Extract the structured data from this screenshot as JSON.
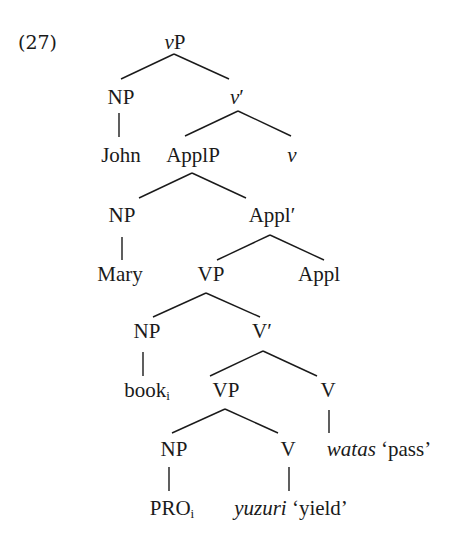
{
  "example_number": "(27)",
  "tree": {
    "root": {
      "label": "vP",
      "cat_italic": "v",
      "cat_rest": "P"
    },
    "subject_np": {
      "label": "NP",
      "terminal": "John"
    },
    "v_bar": {
      "cat_italic": "v",
      "rest": "′"
    },
    "v_head": {
      "label": "v"
    },
    "applp": {
      "label": "ApplP"
    },
    "applp_np": {
      "label": "NP",
      "terminal": "Mary"
    },
    "appl_bar": {
      "label": "Appl′"
    },
    "appl_head": {
      "label": "Appl"
    },
    "vp_upper": {
      "label": "VP"
    },
    "vp_upper_np": {
      "label": "NP",
      "terminal_base": "book",
      "terminal_index": "i"
    },
    "v_bar_upper": {
      "label": "V′"
    },
    "v_upper_head": {
      "label": "V",
      "word": "watas",
      "gloss": "‘pass’"
    },
    "vp_lower": {
      "label": "VP"
    },
    "vp_lower_np": {
      "label": "NP",
      "terminal_base": "PRO",
      "terminal_index": "i"
    },
    "v_lower_head": {
      "label": "V",
      "word": "yuzuri",
      "gloss": "‘yield’"
    }
  },
  "colors": {
    "ink": "#1a1a1a",
    "background": "#ffffff"
  }
}
